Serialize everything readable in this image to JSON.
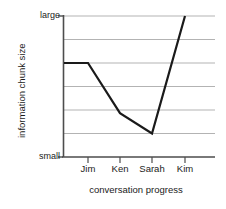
{
  "chart_data": {
    "type": "line",
    "title": "",
    "subtitle": "",
    "xlabel": "conversation progress",
    "ylabel": "information chunk size",
    "categories": [
      "Jim",
      "Ken",
      "Sarah",
      "Kim"
    ],
    "series": [
      {
        "name": "information chunk size",
        "values": [
          4.0,
          1.87,
          1.0,
          6.0
        ]
      }
    ],
    "y_tick_labels": [
      "small",
      "large"
    ],
    "ylim": [
      0,
      6
    ],
    "ylim_labels": {
      "min": "small",
      "max": "large"
    },
    "xlim_categories": [
      "Jim",
      "Ken",
      "Sarah",
      "Kim"
    ],
    "gridlines": {
      "horizontal": true,
      "horizontal_count": 7,
      "vertical": false
    },
    "legend": {
      "visible": false,
      "position": "none"
    },
    "annotations": [],
    "line_style": {
      "color": "#1a1a1a",
      "width": 2.2,
      "markers": "none"
    }
  },
  "axes": {
    "y_top_label": "large",
    "y_bottom_label": "small",
    "y_axis_title": "information chunk size",
    "x_axis_title": "conversation progress",
    "x_tick_labels": [
      "Jim",
      "Ken",
      "Sarah",
      "Kim"
    ]
  },
  "colors": {
    "line": "#1a1a1a",
    "grid": "#b3b3b3",
    "axis": "#3d3d3d",
    "text": "#1a1a1a",
    "background": "#ffffff"
  }
}
